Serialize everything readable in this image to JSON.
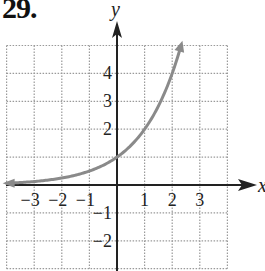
{
  "problem": {
    "number": "29."
  },
  "chart_data": {
    "type": "line",
    "title": "",
    "xlabel": "x",
    "ylabel": "y",
    "xlim": [
      -4,
      4
    ],
    "ylim": [
      -3,
      5
    ],
    "grid": true,
    "grid_style": "dotted",
    "x_tick_labels": [
      "−3",
      "−2",
      "−1",
      "1",
      "2",
      "3"
    ],
    "x_ticks": [
      -3,
      -2,
      -1,
      1,
      2,
      3
    ],
    "y_tick_labels": [
      "4",
      "3",
      "2",
      "−1",
      "−2"
    ],
    "y_ticks": [
      4,
      3,
      2,
      -1,
      -2
    ],
    "series": [
      {
        "name": "y = 2^x",
        "function": "2^x",
        "color": "#8a8a8a",
        "x": [
          -4,
          -3,
          -2,
          -1,
          0,
          1,
          2,
          2.32
        ],
        "y": [
          0.0625,
          0.125,
          0.25,
          0.5,
          1,
          2,
          4,
          5
        ],
        "arrow_ends": true
      }
    ],
    "colors": {
      "axes": "#222222",
      "grid": "#9a9a9a",
      "curve": "#8a8a8a"
    }
  }
}
